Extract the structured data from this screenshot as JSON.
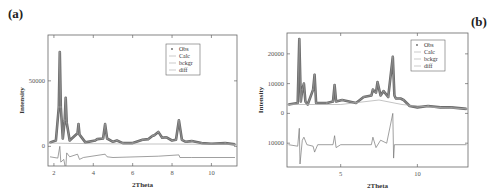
{
  "figure": {
    "panel_a_label": "(a)",
    "panel_b_label": "(b)"
  },
  "chart_data": [
    {
      "type": "line",
      "panel": "(a)",
      "title": "",
      "xlabel": "2Theta",
      "ylabel": "Intensity",
      "xlim": [
        1.7,
        11.3
      ],
      "ylim": [
        -15000,
        85000
      ],
      "xticks": [
        2,
        4,
        6,
        8,
        10
      ],
      "yticks": [
        0,
        50000
      ],
      "grid": false,
      "legend": {
        "position": "upper right",
        "entries": [
          "Obs",
          "Calc",
          "bckgr",
          "diff"
        ]
      },
      "series": [
        {
          "name": "Obs",
          "style": "markers",
          "x": [
            1.8,
            2.1,
            2.25,
            2.3,
            2.35,
            2.45,
            2.55,
            2.6,
            2.65,
            2.8,
            3.2,
            3.25,
            3.3,
            3.6,
            4.1,
            4.2,
            4.5,
            4.6,
            4.7,
            5.0,
            5.2,
            5.5,
            6.0,
            6.5,
            6.8,
            7.0,
            7.1,
            7.3,
            7.5,
            7.7,
            8.0,
            8.2,
            8.35,
            8.5,
            8.7,
            9.0,
            9.5,
            10.0,
            10.7,
            11.2
          ],
          "y": [
            3000,
            4500,
            30000,
            72000,
            30000,
            6000,
            20000,
            37000,
            18000,
            4500,
            10000,
            17000,
            9000,
            3000,
            4500,
            5500,
            6000,
            17000,
            6000,
            3500,
            4500,
            2500,
            2500,
            5000,
            5500,
            8000,
            8500,
            11000,
            6500,
            7000,
            4500,
            5000,
            20000,
            5000,
            3500,
            4000,
            2500,
            2000,
            2500,
            1500
          ]
        },
        {
          "name": "Calc",
          "style": "line",
          "x": [
            1.8,
            2.1,
            2.25,
            2.3,
            2.35,
            2.45,
            2.55,
            2.6,
            2.65,
            2.8,
            3.2,
            3.25,
            3.3,
            3.6,
            4.1,
            4.2,
            4.5,
            4.6,
            4.7,
            5.0,
            5.2,
            5.5,
            6.0,
            6.5,
            6.8,
            7.0,
            7.1,
            7.3,
            7.5,
            7.7,
            8.0,
            8.2,
            8.35,
            8.5,
            8.7,
            9.0,
            9.5,
            10.0,
            10.7,
            11.2
          ],
          "y": [
            3000,
            4500,
            30000,
            72000,
            30000,
            6000,
            20000,
            37000,
            18000,
            4500,
            10000,
            17000,
            9000,
            3000,
            4500,
            5500,
            6000,
            17000,
            6000,
            3500,
            4500,
            2500,
            2500,
            5000,
            5500,
            8000,
            8500,
            11000,
            6500,
            7000,
            4500,
            5000,
            20000,
            5000,
            3500,
            4000,
            2500,
            2000,
            2500,
            1500
          ]
        },
        {
          "name": "bckgr",
          "style": "line",
          "x": [
            1.7,
            4,
            6,
            8,
            10,
            11.3
          ],
          "y": [
            2500,
            2000,
            1800,
            1800,
            1500,
            1500
          ]
        },
        {
          "name": "diff",
          "style": "line",
          "x": [
            1.8,
            2.2,
            2.3,
            2.35,
            2.5,
            2.6,
            2.65,
            2.8,
            3.2,
            3.3,
            3.5,
            4.6,
            4.7,
            5.0,
            7.3,
            8.35,
            8.4,
            9.0,
            11.2
          ],
          "y": [
            -8000,
            -9000,
            0,
            -12000,
            -10000,
            -18000,
            -5000,
            -8000,
            -6000,
            -10000,
            -8500,
            -6000,
            -8000,
            -8500,
            -7500,
            -6500,
            -8500,
            -8500,
            -8500
          ]
        }
      ]
    },
    {
      "type": "line",
      "panel": "(b)",
      "title": "",
      "xlabel": "2Theta",
      "ylabel": "Intensity",
      "xlim": [
        1.5,
        13.3
      ],
      "ylim": [
        -18000,
        27000
      ],
      "xticks": [
        5,
        10
      ],
      "yticks": [
        -10000,
        0,
        10000,
        20000
      ],
      "ytick_labels": [
        "10000",
        "0",
        "10000",
        "20000"
      ],
      "grid": false,
      "legend": {
        "position": "upper right",
        "entries": [
          "Obs",
          "Calc",
          "bckgr",
          "diff"
        ]
      },
      "series": [
        {
          "name": "Obs",
          "style": "markers",
          "x": [
            1.6,
            2.2,
            2.3,
            2.4,
            2.5,
            2.6,
            2.7,
            2.85,
            3.2,
            3.3,
            3.4,
            4.1,
            4.5,
            4.6,
            4.7,
            5.1,
            6.0,
            6.5,
            7.0,
            7.1,
            7.3,
            7.4,
            7.6,
            7.8,
            8.1,
            8.4,
            8.5,
            8.6,
            8.9,
            9.1,
            9.5,
            10.0,
            10.7,
            11.5,
            12.2,
            13.2
          ],
          "y": [
            3000,
            3500,
            25000,
            4000,
            8000,
            10000,
            4000,
            3000,
            8000,
            13000,
            3500,
            3500,
            4000,
            9500,
            4000,
            4500,
            3500,
            5500,
            6000,
            8000,
            7000,
            10500,
            6000,
            7500,
            5500,
            19000,
            6000,
            5000,
            5000,
            4500,
            2500,
            2000,
            2500,
            2000,
            2000,
            1500
          ]
        },
        {
          "name": "Calc",
          "style": "line",
          "x": [
            1.6,
            2.2,
            2.3,
            2.4,
            2.5,
            2.6,
            2.7,
            2.85,
            3.2,
            3.3,
            3.4,
            4.1,
            4.5,
            4.6,
            4.7,
            5.1,
            6.0,
            6.5,
            7.0,
            7.1,
            7.3,
            7.4,
            7.6,
            7.8,
            8.1,
            8.4,
            8.5,
            8.6,
            8.9,
            9.1,
            9.5,
            10.0,
            10.7,
            11.5,
            12.2,
            13.2
          ],
          "y": [
            3000,
            3500,
            25000,
            4000,
            8000,
            10000,
            4000,
            3000,
            8000,
            13000,
            3500,
            3500,
            4000,
            9500,
            4000,
            4500,
            3500,
            5500,
            6000,
            8000,
            7000,
            10500,
            6000,
            7500,
            5500,
            19000,
            6000,
            5000,
            5000,
            4500,
            2500,
            2000,
            2500,
            2000,
            2000,
            1500
          ]
        },
        {
          "name": "bckgr",
          "style": "line",
          "x": [
            1.5,
            5,
            7.5,
            9,
            11,
            13.3
          ],
          "y": [
            3000,
            3000,
            4500,
            3000,
            2000,
            1500
          ]
        },
        {
          "name": "diff",
          "style": "line",
          "x": [
            1.6,
            2.2,
            2.3,
            2.35,
            2.5,
            2.6,
            2.8,
            3.2,
            3.3,
            3.5,
            4.5,
            4.6,
            4.7,
            5.0,
            7.0,
            7.1,
            7.3,
            7.6,
            8.0,
            8.4,
            8.45,
            8.5,
            9.0,
            13.2
          ],
          "y": [
            -10500,
            -11000,
            -5000,
            -17000,
            -9000,
            -8000,
            -10500,
            -11000,
            -13000,
            -10500,
            -10500,
            -7500,
            -11500,
            -10500,
            -10500,
            -8000,
            -11500,
            -9000,
            -10000,
            0,
            -15000,
            -10500,
            -10500,
            -10500
          ]
        }
      ]
    }
  ]
}
